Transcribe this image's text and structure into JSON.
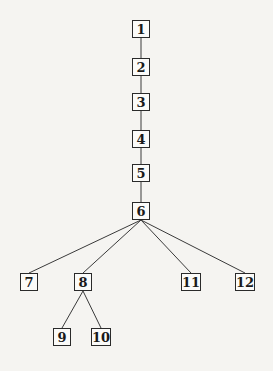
{
  "diagram": {
    "type": "tree",
    "nodes": [
      {
        "id": "1",
        "label": "1",
        "cx": 141,
        "cy": 29,
        "w": 18
      },
      {
        "id": "2",
        "label": "2",
        "cx": 141,
        "cy": 67,
        "w": 18
      },
      {
        "id": "3",
        "label": "3",
        "cx": 141,
        "cy": 102,
        "w": 18
      },
      {
        "id": "4",
        "label": "4",
        "cx": 141,
        "cy": 139,
        "w": 18
      },
      {
        "id": "5",
        "label": "5",
        "cx": 141,
        "cy": 173,
        "w": 18
      },
      {
        "id": "6",
        "label": "6",
        "cx": 141,
        "cy": 211,
        "w": 18
      },
      {
        "id": "7",
        "label": "7",
        "cx": 29,
        "cy": 282,
        "w": 18
      },
      {
        "id": "8",
        "label": "8",
        "cx": 83,
        "cy": 282,
        "w": 18
      },
      {
        "id": "9",
        "label": "9",
        "cx": 62,
        "cy": 337,
        "w": 18
      },
      {
        "id": "10",
        "label": "10",
        "cx": 101,
        "cy": 337,
        "w": 20
      },
      {
        "id": "11",
        "label": "11",
        "cx": 191,
        "cy": 282,
        "w": 20
      },
      {
        "id": "12",
        "label": "12",
        "cx": 245,
        "cy": 282,
        "w": 20
      }
    ],
    "edges": [
      [
        "1",
        "2"
      ],
      [
        "2",
        "3"
      ],
      [
        "3",
        "4"
      ],
      [
        "4",
        "5"
      ],
      [
        "5",
        "6"
      ],
      [
        "6",
        "7"
      ],
      [
        "6",
        "8"
      ],
      [
        "6",
        "11"
      ],
      [
        "6",
        "12"
      ],
      [
        "8",
        "9"
      ],
      [
        "8",
        "10"
      ]
    ],
    "line_color": "#3a3a3a"
  }
}
